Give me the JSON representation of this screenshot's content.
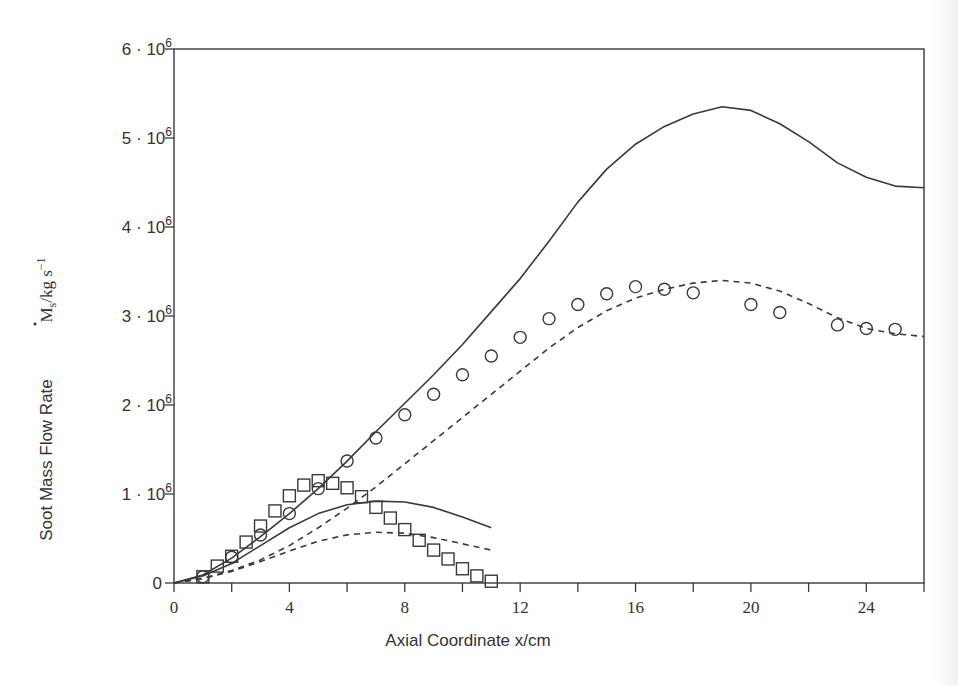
{
  "chart_data": {
    "type": "line",
    "title": "",
    "xlabel": "Axial Coordinate x/cm",
    "ylabel_text": "Soot Mass Flow Rate",
    "ylabel_symbol": "M",
    "ylabel_subscript": "s",
    "ylabel_units": "/kg s",
    "ylabel_units_exp": "−1",
    "xlim": [
      0,
      26
    ],
    "ylim": [
      0,
      6000000
    ],
    "grid": false,
    "legend": "none",
    "x_ticks": [
      0,
      2,
      4,
      6,
      8,
      10,
      12,
      14,
      16,
      18,
      20,
      22,
      24,
      26
    ],
    "x_tick_labels": [
      {
        "x": 0,
        "label": "0"
      },
      {
        "x": 4,
        "label": "4"
      },
      {
        "x": 8,
        "label": "8"
      },
      {
        "x": 12,
        "label": "12"
      },
      {
        "x": 16,
        "label": "16"
      },
      {
        "x": 20,
        "label": "20"
      },
      {
        "x": 24,
        "label": "24"
      }
    ],
    "y_tick_labels": [
      {
        "y": 0,
        "mant": "0",
        "exp": ""
      },
      {
        "y": 1,
        "mant": "1 · 10",
        "exp": "6"
      },
      {
        "y": 2,
        "mant": "2 · 10",
        "exp": "6"
      },
      {
        "y": 3,
        "mant": "3 · 10",
        "exp": "6"
      },
      {
        "y": 4,
        "mant": "4 · 10",
        "exp": "6"
      },
      {
        "y": 5,
        "mant": "5 · 10",
        "exp": "6"
      },
      {
        "y": 6,
        "mant": "6 · 10",
        "exp": "6"
      }
    ],
    "y_unit_scale": 1000000,
    "series": [
      {
        "name": "Model A (solid) – long flame",
        "style": "solid",
        "marker": "none",
        "x": [
          0,
          1,
          2,
          3,
          4,
          5,
          6,
          7,
          8,
          9,
          10,
          11,
          12,
          13,
          14,
          15,
          16,
          17,
          18,
          19,
          20,
          21,
          22,
          23,
          24,
          25,
          26
        ],
        "y": [
          0,
          0.09,
          0.28,
          0.52,
          0.78,
          1.06,
          1.37,
          1.7,
          2.02,
          2.34,
          2.68,
          3.05,
          3.42,
          3.84,
          4.28,
          4.65,
          4.93,
          5.13,
          5.27,
          5.35,
          5.31,
          5.16,
          4.96,
          4.72,
          4.56,
          4.46,
          4.44
        ]
      },
      {
        "name": "Model B (dashed) – long flame",
        "style": "dashed",
        "marker": "none",
        "x": [
          0,
          1,
          2,
          3,
          4,
          5,
          6,
          7,
          8,
          9,
          10,
          11,
          12,
          13,
          14,
          15,
          16,
          17,
          18,
          19,
          20,
          21,
          22,
          23,
          24,
          25,
          26
        ],
        "y": [
          0,
          0.05,
          0.14,
          0.26,
          0.42,
          0.62,
          0.84,
          1.08,
          1.34,
          1.6,
          1.86,
          2.12,
          2.38,
          2.64,
          2.87,
          3.06,
          3.2,
          3.3,
          3.37,
          3.4,
          3.37,
          3.28,
          3.14,
          2.98,
          2.86,
          2.8,
          2.77
        ]
      },
      {
        "name": "Model A (solid) – short flame",
        "style": "solid",
        "marker": "none",
        "x": [
          0,
          1,
          2,
          3,
          4,
          5,
          6,
          7,
          8,
          9,
          10,
          11
        ],
        "y": [
          0,
          0.08,
          0.22,
          0.42,
          0.62,
          0.78,
          0.88,
          0.92,
          0.91,
          0.85,
          0.74,
          0.62
        ]
      },
      {
        "name": "Model B (dashed) – short flame",
        "style": "dashed",
        "marker": "none",
        "x": [
          0,
          1,
          2,
          3,
          4,
          5,
          6,
          7,
          8,
          9,
          10,
          11
        ],
        "y": [
          0,
          0.05,
          0.13,
          0.24,
          0.36,
          0.47,
          0.54,
          0.57,
          0.56,
          0.51,
          0.44,
          0.37
        ]
      },
      {
        "name": "Measured (circles)",
        "style": "none",
        "marker": "circle",
        "x": [
          1,
          2,
          3,
          4,
          5,
          6,
          7,
          8,
          9,
          10,
          11,
          12,
          13,
          14,
          15,
          16,
          17,
          18,
          20,
          21,
          23,
          24,
          25
        ],
        "y": [
          0.07,
          0.29,
          0.54,
          0.78,
          1.06,
          1.37,
          1.63,
          1.89,
          2.12,
          2.34,
          2.55,
          2.76,
          2.97,
          3.13,
          3.25,
          3.33,
          3.3,
          3.26,
          3.13,
          3.04,
          2.9,
          2.86,
          2.85
        ]
      },
      {
        "name": "Measured (squares)",
        "style": "none",
        "marker": "square",
        "x": [
          1,
          1.5,
          2,
          2.5,
          3,
          3.5,
          4,
          4.5,
          5,
          5.5,
          6,
          6.5,
          7,
          7.5,
          8,
          8.5,
          9,
          9.5,
          10,
          10.5,
          11
        ],
        "y": [
          0.07,
          0.19,
          0.3,
          0.46,
          0.64,
          0.81,
          0.98,
          1.1,
          1.15,
          1.12,
          1.07,
          0.97,
          0.85,
          0.73,
          0.6,
          0.48,
          0.37,
          0.27,
          0.16,
          0.08,
          0.02
        ]
      }
    ]
  }
}
